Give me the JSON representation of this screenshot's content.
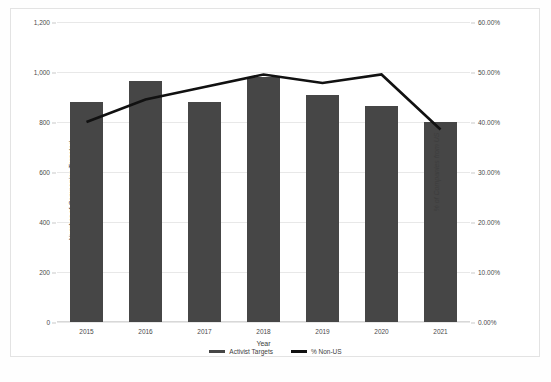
{
  "chart_data": {
    "type": "bar",
    "title": "",
    "categories": [
      "2015",
      "2016",
      "2017",
      "2018",
      "2019",
      "2020",
      "2021"
    ],
    "xlabel": "Year",
    "ylabel": "Number of Companies Targeted",
    "y2label": "% of Companies from US",
    "ylim": [
      0,
      1200
    ],
    "y2lim": [
      0,
      0.6
    ],
    "grid": true,
    "legend_position": "bottom",
    "left_ticks": [
      "0",
      "200",
      "400",
      "600",
      "800",
      "1,000",
      "1,200"
    ],
    "left_tick_values": [
      0,
      200,
      400,
      600,
      800,
      1000,
      1200
    ],
    "right_ticks": [
      "0.00%",
      "10.00%",
      "20.00%",
      "30.00%",
      "40.00%",
      "50.00%",
      "60.00%"
    ],
    "right_tick_values": [
      0,
      10,
      20,
      30,
      40,
      50,
      60
    ],
    "series": [
      {
        "name": "Activist Targets",
        "type": "bar",
        "axis": "left",
        "color": "#464646",
        "values": [
          880,
          965,
          880,
          980,
          910,
          865,
          800
        ]
      },
      {
        "name": "% Non-US",
        "type": "line",
        "axis": "right",
        "color": "#111111",
        "values": [
          40.0,
          44.5,
          47.0,
          49.5,
          47.8,
          49.5,
          38.5
        ]
      }
    ]
  },
  "legend": {
    "items": [
      {
        "label": "Activist Targets",
        "color": "#464646"
      },
      {
        "label": "% Non-US",
        "color": "#111111"
      }
    ]
  },
  "caption": {
    "text": ""
  }
}
